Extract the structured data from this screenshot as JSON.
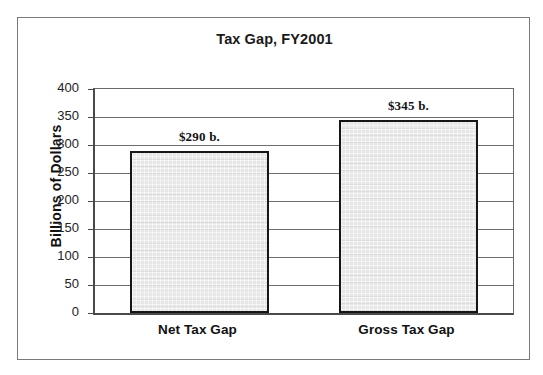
{
  "chart_data": {
    "type": "bar",
    "title": "Tax Gap, FY2001",
    "xlabel": "",
    "ylabel": "Billions of Dollars",
    "categories": [
      "Net Tax Gap",
      "Gross Tax Gap"
    ],
    "values": [
      290,
      345
    ],
    "data_labels": [
      "$290 b.",
      "$345 b."
    ],
    "ylim": [
      0,
      400
    ],
    "ytick_labels": [
      "400",
      "350",
      "300",
      "250",
      "200",
      "150",
      "100",
      "50",
      "0"
    ],
    "ytick_values": [
      400,
      350,
      300,
      250,
      200,
      150,
      100,
      50,
      0
    ],
    "grid": true,
    "legend": null,
    "legend_position": "none",
    "bar_fill_color": "#e7e7e7",
    "bar_border_color": "#151515",
    "axis_color": "#4a4a4a",
    "gridline_color": "#6e6e6e",
    "frame_color": "#7a7a7a",
    "text_color": "#111111"
  }
}
